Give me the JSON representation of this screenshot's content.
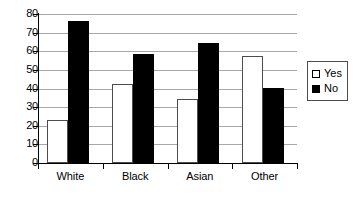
{
  "chart_data": {
    "type": "bar",
    "title": "",
    "subtitle": "",
    "xlabel": "",
    "ylabel": "",
    "categories": [
      "White",
      "Black",
      "Asian",
      "Other"
    ],
    "series": [
      {
        "name": "Yes",
        "values": [
          23,
          42.5,
          34.5,
          57.5
        ],
        "color": "#ffffff"
      },
      {
        "name": "No",
        "values": [
          76,
          58.5,
          64.5,
          40.5
        ],
        "color": "#000000"
      }
    ],
    "ylim": [
      0,
      80
    ],
    "yticks": [
      0,
      10,
      20,
      30,
      40,
      50,
      60,
      70,
      80
    ],
    "ytick_labels": [
      "0",
      "10",
      "20",
      "30",
      "40",
      "50",
      "60",
      "70",
      "80"
    ],
    "grid": true,
    "grid_axis": "y",
    "legend_position": "right",
    "legend_entries": [
      {
        "label": "Yes",
        "swatch": "hollow-square"
      },
      {
        "label": "No",
        "swatch": "filled-square"
      }
    ],
    "background_color": "#ffffff",
    "axis_color": "#000000",
    "gridline_color": "#a8a8a8"
  }
}
